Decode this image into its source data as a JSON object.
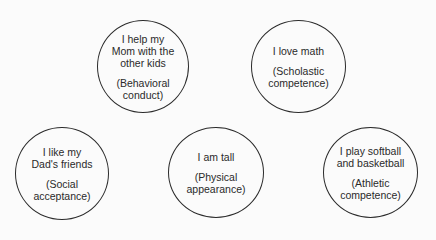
{
  "nodes": [
    {
      "id": "behavioral-conduct",
      "statement": "I help my\nMom with the\nother kids",
      "domain": "(Behavioral\nconduct)"
    },
    {
      "id": "scholastic-competence",
      "statement": "I love math",
      "domain": "(Scholastic\ncompetence)"
    },
    {
      "id": "social-acceptance",
      "statement": "I like my\nDad's friends",
      "domain": "(Social\nacceptance)"
    },
    {
      "id": "physical-appearance",
      "statement": "I am tall",
      "domain": "(Physical\nappearance)"
    },
    {
      "id": "athletic-competence",
      "statement": "I play softball\nand basketball",
      "domain": "(Athletic\ncompetence)"
    }
  ]
}
